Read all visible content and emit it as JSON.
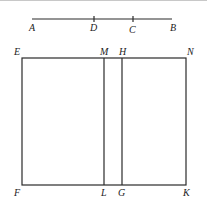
{
  "diagram": {
    "segment": {
      "points": [
        {
          "label": "A",
          "x": 32
        },
        {
          "label": "D",
          "x": 94
        },
        {
          "label": "C",
          "x": 133
        },
        {
          "label": "B",
          "x": 172
        }
      ]
    },
    "rectangle": {
      "corners": {
        "top_left": "E",
        "top_right": "N",
        "bottom_left": "F",
        "bottom_right": "K"
      },
      "dividers": [
        {
          "top": "M",
          "bottom": "L"
        },
        {
          "top": "H",
          "bottom": "G"
        }
      ]
    },
    "labels": {
      "A": "A",
      "D": "D",
      "C": "C",
      "B": "B",
      "E": "E",
      "M": "M",
      "H": "H",
      "N": "N",
      "F": "F",
      "L": "L",
      "G": "G",
      "K": "K"
    }
  }
}
